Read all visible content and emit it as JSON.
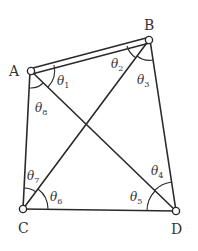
{
  "diagram": {
    "type": "four-bar linkage quadrilateral with diagonals",
    "colors": {
      "stroke": "#2a2a2a",
      "background": "#ffffff",
      "text": "#333333"
    },
    "vertices": [
      {
        "id": "A",
        "label": "A",
        "x": 31,
        "y": 71
      },
      {
        "id": "B",
        "label": "B",
        "x": 149,
        "y": 40
      },
      {
        "id": "C",
        "label": "C",
        "x": 23,
        "y": 209
      },
      {
        "id": "D",
        "label": "D",
        "x": 176,
        "y": 211
      }
    ],
    "edges": [
      {
        "from": "A",
        "to": "B",
        "style": "double"
      },
      {
        "from": "B",
        "to": "D",
        "style": "single"
      },
      {
        "from": "D",
        "to": "C",
        "style": "single"
      },
      {
        "from": "C",
        "to": "A",
        "style": "single"
      },
      {
        "from": "A",
        "to": "D",
        "style": "single"
      },
      {
        "from": "B",
        "to": "C",
        "style": "single"
      }
    ],
    "angles": [
      {
        "symbol": "θ",
        "sub": "1",
        "vertex": "A",
        "between": [
          "AB",
          "AD"
        ]
      },
      {
        "symbol": "θ",
        "sub": "2",
        "vertex": "B",
        "between": [
          "BA",
          "BC"
        ]
      },
      {
        "symbol": "θ",
        "sub": "3",
        "vertex": "B",
        "between": [
          "BC",
          "BD"
        ]
      },
      {
        "symbol": "θ",
        "sub": "4",
        "vertex": "D",
        "between": [
          "DB",
          "DA"
        ]
      },
      {
        "symbol": "θ",
        "sub": "5",
        "vertex": "D",
        "between": [
          "DA",
          "DC"
        ]
      },
      {
        "symbol": "θ",
        "sub": "6",
        "vertex": "C",
        "between": [
          "CD",
          "CB"
        ]
      },
      {
        "symbol": "θ",
        "sub": "7",
        "vertex": "C",
        "between": [
          "CB",
          "CA"
        ]
      },
      {
        "symbol": "θ",
        "sub": "8",
        "vertex": "A",
        "between": [
          "AD",
          "AC"
        ]
      }
    ]
  }
}
